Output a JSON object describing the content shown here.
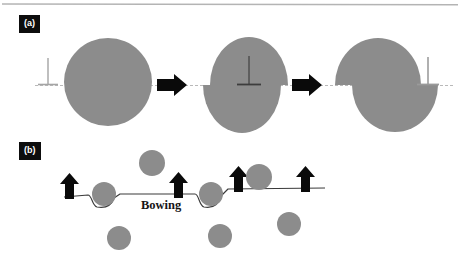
{
  "figure": {
    "width": 460,
    "height": 261,
    "background": "#ffffff",
    "top_rule_color": "#b4b4b4"
  },
  "colors": {
    "particle_gray": "#8c8c8c",
    "particle_gray_light": "#9a9a9a",
    "arrow_black": "#0a0a0a",
    "slip_plane_line": "#b9b9b9",
    "dislocation_line": "#3a3a3a",
    "label_box_bg": "#0d0d0d",
    "label_text": "#ffffff",
    "text_dark": "#151515"
  },
  "panel_a": {
    "label": "(a)",
    "caption_visible": false,
    "stages": [
      {
        "name": "stage-1-uncut-particle",
        "shape": "circle",
        "cx": 108,
        "cy": 82,
        "r": 44,
        "offset": 0,
        "dislocation_symbol": {
          "x": 48,
          "y_top": 58,
          "y_base": 83,
          "bar_half_width": 10
        }
      },
      {
        "name": "stage-2-dislocation-entering-particle",
        "shape": "ellipse",
        "cx": 249,
        "cy": 82,
        "rx": 39,
        "ry": 48,
        "offset": 7,
        "dislocation_symbol": {
          "x": 249,
          "y_top": 56,
          "y_base": 83,
          "bar_half_width": 12
        }
      },
      {
        "name": "stage-3-sheared-particle",
        "shape": "ellipse",
        "cx": 392,
        "cy": 82,
        "rx": 43,
        "ry": 47,
        "offset": 17,
        "dislocation_symbol": {
          "x": 428,
          "y_top": 57,
          "y_base": 82,
          "bar_half_width": 11
        }
      }
    ],
    "transition_arrows": [
      {
        "name": "transition-arrow-1",
        "x": 157,
        "y": 85,
        "length": 30,
        "direction": "right"
      },
      {
        "name": "transition-arrow-2",
        "x": 292,
        "y": 85,
        "length": 30,
        "direction": "right"
      }
    ],
    "slip_plane": {
      "name": "slip-plane-dashed-line",
      "y": 85,
      "x_start": 35,
      "x_end": 455,
      "style": "dashed"
    }
  },
  "panel_b": {
    "label": "(b)",
    "annotation": "Bowing",
    "mechanism": "orowan-bowing",
    "dislocation_line": {
      "name": "bowed-dislocation-line",
      "base_y": 196,
      "x_start": 64,
      "x_end": 325
    },
    "force_arrows": [
      {
        "name": "force-arrow-1",
        "x": 69,
        "y_tip": 177,
        "y_tail": 199
      },
      {
        "name": "force-arrow-2",
        "x": 178,
        "y_tip": 177,
        "y_tail": 199
      },
      {
        "name": "force-arrow-3",
        "x": 239,
        "y_tip": 172,
        "y_tail": 196
      },
      {
        "name": "force-arrow-4",
        "x": 306,
        "y_tip": 172,
        "y_tail": 196
      },
      {
        "name": "force-arrow-5",
        "x": 306,
        "y_tip": 172,
        "y_tail": 196
      }
    ],
    "pinning_particles": [
      {
        "name": "pinning-particle-1",
        "cx": 104,
        "cy": 194,
        "r": 12
      },
      {
        "name": "pinning-particle-2",
        "cx": 211,
        "cy": 194,
        "r": 12
      }
    ],
    "free_particles": [
      {
        "name": "free-particle-above-1",
        "cx": 152,
        "cy": 163,
        "r": 13
      },
      {
        "name": "free-particle-above-2",
        "cx": 259,
        "cy": 176,
        "r": 13
      },
      {
        "name": "free-particle-below-1",
        "cx": 119,
        "cy": 238,
        "r": 12
      },
      {
        "name": "free-particle-below-2",
        "cx": 220,
        "cy": 236,
        "r": 12
      },
      {
        "name": "free-particle-below-3",
        "cx": 289,
        "cy": 224,
        "r": 12
      }
    ]
  }
}
